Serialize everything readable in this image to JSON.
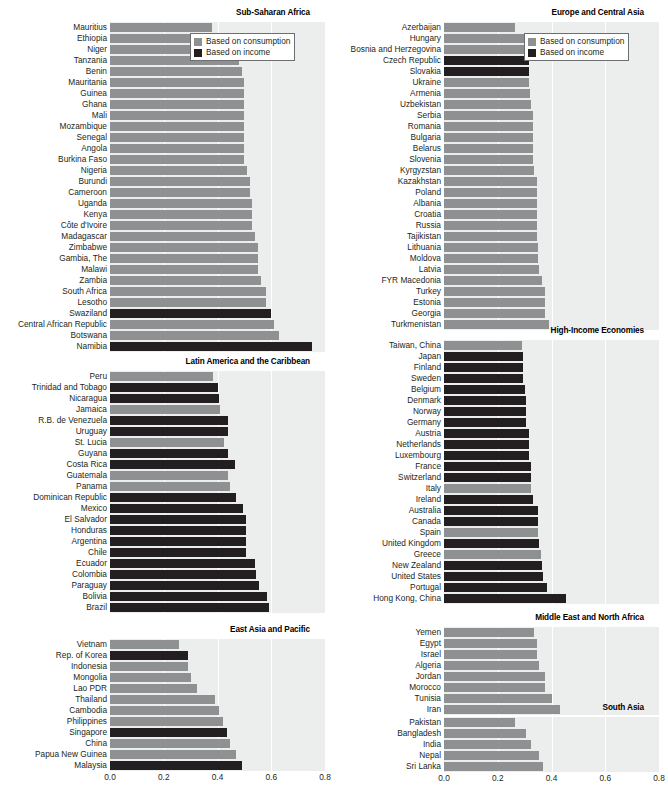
{
  "legend": {
    "consumption_label": "Based on consumption",
    "income_label": "Based on income",
    "consumption_color": "#8e9091",
    "income_color": "#231f20"
  },
  "axis": {
    "ticks": [
      "0.0",
      "0.2",
      "0.4",
      "0.6",
      "0.8"
    ],
    "min": 0.0,
    "max": 0.8
  },
  "footnote": "",
  "chart_data": [
    {
      "type": "bar",
      "title": "Sub-Saharan Africa",
      "xlabel": "",
      "ylabel": "",
      "xlim": [
        0.0,
        0.8
      ],
      "orientation": "horizontal",
      "grid": true,
      "legend_position": "top-right",
      "series_names": [
        "Based on consumption",
        "Based on income"
      ],
      "categories": [
        "Mauritius",
        "Ethiopia",
        "Niger",
        "Tanzania",
        "Benin",
        "Mauritania",
        "Guinea",
        "Ghana",
        "Mali",
        "Mozambique",
        "Senegal",
        "Angola",
        "Burkina Faso",
        "Nigeria",
        "Burundi",
        "Cameroon",
        "Uganda",
        "Kenya",
        "Côte d'Ivoire",
        "Madagascar",
        "Zimbabwe",
        "Gambia, The",
        "Malawi",
        "Zambia",
        "South Africa",
        "Lesotho",
        "Swaziland",
        "Central African Republic",
        "Botswana",
        "Namibia"
      ],
      "values": [
        0.38,
        0.44,
        0.47,
        0.48,
        0.49,
        0.5,
        0.5,
        0.5,
        0.5,
        0.5,
        0.5,
        0.5,
        0.5,
        0.51,
        0.52,
        0.52,
        0.53,
        0.53,
        0.53,
        0.54,
        0.55,
        0.55,
        0.55,
        0.56,
        0.58,
        0.58,
        0.6,
        0.61,
        0.63,
        0.75
      ],
      "basis": [
        "consumption",
        "consumption",
        "consumption",
        "consumption",
        "consumption",
        "consumption",
        "consumption",
        "consumption",
        "consumption",
        "consumption",
        "consumption",
        "consumption",
        "consumption",
        "consumption",
        "consumption",
        "consumption",
        "consumption",
        "consumption",
        "consumption",
        "consumption",
        "consumption",
        "consumption",
        "consumption",
        "consumption",
        "consumption",
        "consumption",
        "income",
        "consumption",
        "consumption",
        "income"
      ]
    },
    {
      "type": "bar",
      "title": "Latin America and the Caribbean",
      "xlabel": "",
      "ylabel": "",
      "xlim": [
        0.0,
        0.8
      ],
      "orientation": "horizontal",
      "grid": true,
      "series_names": [
        "Based on consumption",
        "Based on income"
      ],
      "categories": [
        "Peru",
        "Trinidad and Tobago",
        "Nicaragua",
        "Jamaica",
        "R.B. de Venezuela",
        "Uruguay",
        "St. Lucia",
        "Guyana",
        "Costa Rica",
        "Guatemala",
        "Panama",
        "Dominican Republic",
        "Mexico",
        "El Salvador",
        "Honduras",
        "Argentina",
        "Chile",
        "Ecuador",
        "Colombia",
        "Paraguay",
        "Bolivia",
        "Brazil"
      ],
      "values": [
        0.385,
        0.4,
        0.405,
        0.41,
        0.44,
        0.44,
        0.425,
        0.44,
        0.465,
        0.44,
        0.445,
        0.47,
        0.495,
        0.505,
        0.505,
        0.505,
        0.505,
        0.54,
        0.545,
        0.555,
        0.585,
        0.59
      ],
      "basis": [
        "consumption",
        "income",
        "income",
        "consumption",
        "income",
        "income",
        "consumption",
        "income",
        "income",
        "consumption",
        "consumption",
        "income",
        "income",
        "income",
        "income",
        "income",
        "income",
        "income",
        "income",
        "income",
        "income",
        "income"
      ]
    },
    {
      "type": "bar",
      "title": "East Asia and Pacific",
      "xlabel": "",
      "ylabel": "",
      "xlim": [
        0.0,
        0.8
      ],
      "orientation": "horizontal",
      "grid": true,
      "series_names": [
        "Based on consumption",
        "Based on income"
      ],
      "categories": [
        "Vietnam",
        "Rep. of Korea",
        "Indonesia",
        "Mongolia",
        "Lao PDR",
        "Thailand",
        "Cambodia",
        "Philippines",
        "Singapore",
        "China",
        "Papua New Guinea",
        "Malaysia"
      ],
      "values": [
        0.255,
        0.29,
        0.29,
        0.3,
        0.325,
        0.39,
        0.405,
        0.42,
        0.435,
        0.445,
        0.47,
        0.49
      ],
      "basis": [
        "consumption",
        "income",
        "consumption",
        "consumption",
        "consumption",
        "consumption",
        "consumption",
        "consumption",
        "income",
        "consumption",
        "consumption",
        "income"
      ]
    },
    {
      "type": "bar",
      "title": "Europe and Central Asia",
      "xlabel": "",
      "ylabel": "",
      "xlim": [
        0.0,
        0.8
      ],
      "orientation": "horizontal",
      "grid": true,
      "legend_position": "top-right",
      "series_names": [
        "Based on consumption",
        "Based on income"
      ],
      "categories": [
        "Azerbaijan",
        "Hungary",
        "Bosnia and Herzegovina",
        "Czech Republic",
        "Slovakia",
        "Ukraine",
        "Armenia",
        "Uzbekistan",
        "Serbia",
        "Romania",
        "Bulgaria",
        "Belarus",
        "Slovenia",
        "Kyrgyzstan",
        "Kazakhstan",
        "Poland",
        "Albania",
        "Croatia",
        "Russia",
        "Tajikistan",
        "Lithuania",
        "Moldova",
        "Latvia",
        "FYR Macedonia",
        "Turkey",
        "Estonia",
        "Georgia",
        "Turkmenistan"
      ],
      "values": [
        0.265,
        0.3,
        0.3,
        0.315,
        0.315,
        0.315,
        0.32,
        0.325,
        0.33,
        0.33,
        0.33,
        0.33,
        0.33,
        0.335,
        0.345,
        0.345,
        0.345,
        0.345,
        0.345,
        0.345,
        0.35,
        0.35,
        0.355,
        0.365,
        0.375,
        0.375,
        0.375,
        0.39
      ],
      "basis": [
        "consumption",
        "consumption",
        "consumption",
        "income",
        "income",
        "consumption",
        "consumption",
        "consumption",
        "consumption",
        "consumption",
        "consumption",
        "consumption",
        "consumption",
        "consumption",
        "consumption",
        "consumption",
        "consumption",
        "consumption",
        "consumption",
        "consumption",
        "consumption",
        "consumption",
        "consumption",
        "consumption",
        "consumption",
        "consumption",
        "consumption",
        "consumption"
      ]
    },
    {
      "type": "bar",
      "title": "High-Income Economies",
      "xlabel": "",
      "ylabel": "",
      "xlim": [
        0.0,
        0.8
      ],
      "orientation": "horizontal",
      "grid": true,
      "series_names": [
        "Based on consumption",
        "Based on income"
      ],
      "categories": [
        "Taiwan, China",
        "Japan",
        "Finland",
        "Sweden",
        "Belgium",
        "Denmark",
        "Norway",
        "Germany",
        "Austria",
        "Netherlands",
        "Luxembourg",
        "France",
        "Switzerland",
        "Italy",
        "Ireland",
        "Australia",
        "Canada",
        "Spain",
        "United Kingdom",
        "Greece",
        "New Zealand",
        "United States",
        "Portugal",
        "Hong Kong, China"
      ],
      "values": [
        0.29,
        0.295,
        0.295,
        0.295,
        0.3,
        0.305,
        0.305,
        0.305,
        0.315,
        0.315,
        0.315,
        0.325,
        0.325,
        0.325,
        0.33,
        0.35,
        0.35,
        0.35,
        0.355,
        0.36,
        0.365,
        0.37,
        0.385,
        0.455
      ],
      "basis": [
        "consumption",
        "income",
        "income",
        "income",
        "income",
        "income",
        "income",
        "income",
        "income",
        "income",
        "income",
        "income",
        "income",
        "consumption",
        "income",
        "income",
        "income",
        "consumption",
        "income",
        "consumption",
        "income",
        "income",
        "income",
        "income"
      ]
    },
    {
      "type": "bar",
      "title": "Middle East and North Africa",
      "xlabel": "",
      "ylabel": "",
      "xlim": [
        0.0,
        0.8
      ],
      "orientation": "horizontal",
      "grid": true,
      "series_names": [
        "Based on consumption",
        "Based on income"
      ],
      "categories": [
        "Yemen",
        "Egypt",
        "Israel",
        "Algeria",
        "Jordan",
        "Morocco",
        "Tunisia",
        "Iran"
      ],
      "values": [
        0.335,
        0.345,
        0.345,
        0.355,
        0.375,
        0.375,
        0.4,
        0.43
      ],
      "basis": [
        "consumption",
        "consumption",
        "consumption",
        "consumption",
        "consumption",
        "consumption",
        "consumption",
        "consumption"
      ]
    },
    {
      "type": "bar",
      "title": "South Asia",
      "xlabel": "",
      "ylabel": "",
      "xlim": [
        0.0,
        0.8
      ],
      "orientation": "horizontal",
      "grid": true,
      "series_names": [
        "Based on consumption",
        "Based on income"
      ],
      "categories": [
        "Pakistan",
        "Bangladesh",
        "India",
        "Nepal",
        "Sri Lanka"
      ],
      "values": [
        0.265,
        0.305,
        0.325,
        0.355,
        0.37
      ],
      "basis": [
        "consumption",
        "consumption",
        "consumption",
        "consumption",
        "consumption"
      ]
    }
  ]
}
